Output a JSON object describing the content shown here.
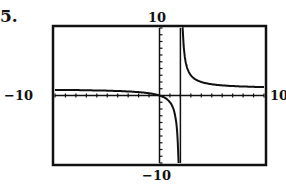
{
  "problem": {
    "number": "5."
  },
  "window_labels": {
    "ymax": "10",
    "ymin": "−10",
    "xmin": "−10",
    "xmax": "10"
  },
  "chart_data": {
    "type": "line",
    "title": "",
    "function": "y = x/(x-2)",
    "xlabel": "",
    "ylabel": "",
    "xlim": [
      -10,
      10
    ],
    "ylim": [
      -10,
      10
    ],
    "x_tick_step": 1,
    "y_tick_step": 1,
    "grid": false,
    "vertical_asymptote": 2,
    "horizontal_asymptote": 1,
    "series": [
      {
        "name": "left branch",
        "x": [
          -10,
          -8,
          -6,
          -4,
          -2,
          -1,
          0,
          0.5,
          1,
          1.5,
          1.8
        ],
        "y": [
          0.83,
          0.8,
          0.75,
          0.67,
          0.5,
          0.33,
          0,
          -0.33,
          -1,
          -3,
          -9
        ]
      },
      {
        "name": "right branch",
        "x": [
          2.2,
          2.5,
          3,
          4,
          5,
          6,
          8,
          10
        ],
        "y": [
          11,
          5,
          3,
          2,
          1.67,
          1.5,
          1.33,
          1.25
        ]
      }
    ]
  }
}
